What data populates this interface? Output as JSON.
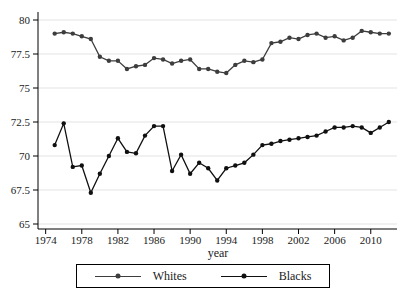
{
  "chart_data": {
    "type": "line",
    "title": "",
    "xlabel": "year",
    "ylabel": "",
    "x": [
      1975,
      1976,
      1977,
      1978,
      1979,
      1980,
      1981,
      1982,
      1983,
      1984,
      1985,
      1986,
      1987,
      1988,
      1989,
      1990,
      1991,
      1992,
      1993,
      1994,
      1995,
      1996,
      1997,
      1998,
      1999,
      2000,
      2001,
      2002,
      2003,
      2004,
      2005,
      2006,
      2007,
      2008,
      2009,
      2010,
      2011,
      2012
    ],
    "series": [
      {
        "name": "Whites",
        "color": "#3d3d3d",
        "values": [
          79.0,
          79.1,
          79.0,
          78.8,
          78.6,
          77.3,
          77.0,
          77.0,
          76.4,
          76.6,
          76.7,
          77.2,
          77.1,
          76.8,
          77.0,
          77.1,
          76.4,
          76.4,
          76.2,
          76.1,
          76.7,
          77.0,
          76.9,
          77.1,
          78.3,
          78.4,
          78.7,
          78.6,
          78.9,
          79.0,
          78.7,
          78.8,
          78.5,
          78.7,
          79.2,
          79.1,
          79.0,
          79.0
        ]
      },
      {
        "name": "Blacks",
        "color": "#101010",
        "values": [
          70.8,
          72.4,
          69.2,
          69.3,
          67.3,
          68.7,
          70.0,
          71.3,
          70.3,
          70.2,
          71.5,
          72.2,
          72.2,
          68.9,
          70.1,
          68.7,
          69.5,
          69.1,
          68.2,
          69.1,
          69.3,
          69.5,
          70.1,
          70.8,
          70.9,
          71.1,
          71.2,
          71.3,
          71.4,
          71.5,
          71.8,
          72.1,
          72.1,
          72.2,
          72.1,
          71.7,
          72.1,
          72.5
        ]
      }
    ],
    "x_ticks": [
      "1974",
      "1978",
      "1982",
      "1986",
      "1990",
      "1994",
      "1998",
      "2002",
      "2006",
      "2010"
    ],
    "x_tick_values": [
      1974,
      1978,
      1982,
      1986,
      1990,
      1994,
      1998,
      2002,
      2006,
      2010
    ],
    "y_ticks": [
      "80",
      "77.5",
      "75",
      "72.5",
      "70",
      "67.5",
      "65"
    ],
    "y_tick_values": [
      80,
      77.5,
      75,
      72.5,
      70,
      67.5,
      65
    ],
    "ylim": [
      64.6,
      80.9
    ],
    "xlim": [
      1973.2,
      2013
    ],
    "grid": "horizontal-only",
    "grid_color": "#e3e3e3",
    "axis_color": "#000000",
    "background": "#ffffff",
    "legend_position": "bottom-center",
    "marker": "filled-circle"
  }
}
